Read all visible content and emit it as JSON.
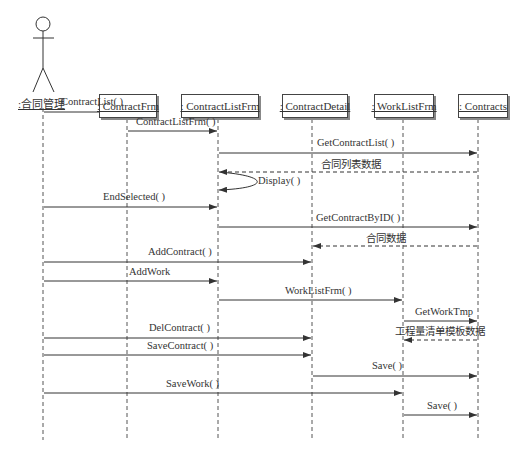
{
  "diagram": {
    "type": "UML sequence diagram",
    "actor": {
      "label": ":合同管理"
    },
    "lifelines": [
      {
        "id": "ContractFrm",
        "label": ": ContractFrm",
        "x": 127
      },
      {
        "id": "ContractListFrm",
        "label": ": ContractListFrm",
        "x": 218
      },
      {
        "id": "ContractDetail",
        "label": ": ContractDetail",
        "x": 312
      },
      {
        "id": "WorkListFrm",
        "label": ": WorkListFrm",
        "x": 403
      },
      {
        "id": "Contracts",
        "label": ": Contracts",
        "x": 478
      }
    ],
    "messages": [
      {
        "label": "ContractList( )",
        "from": "actor",
        "to": "ContractFrm",
        "kind": "call"
      },
      {
        "label": "ContractListFrm( )",
        "from": "ContractFrm",
        "to": "ContractListFrm",
        "kind": "call"
      },
      {
        "label": "GetContractList( )",
        "from": "ContractListFrm",
        "to": "Contracts",
        "kind": "call"
      },
      {
        "label": "合同列表数据",
        "from": "Contracts",
        "to": "ContractListFrm",
        "kind": "return"
      },
      {
        "label": "Display( )",
        "from": "ContractListFrm",
        "to": "ContractListFrm",
        "kind": "self"
      },
      {
        "label": "EndSelected( )",
        "from": "actor",
        "to": "ContractListFrm",
        "kind": "call"
      },
      {
        "label": "GetContractByID( )",
        "from": "ContractListFrm",
        "to": "Contracts",
        "kind": "call"
      },
      {
        "label": "合同数据",
        "from": "Contracts",
        "to": "ContractDetail",
        "kind": "return"
      },
      {
        "label": "AddContract( )",
        "from": "actor",
        "to": "ContractDetail",
        "kind": "call"
      },
      {
        "label": "AddWork",
        "from": "actor",
        "to": "ContractListFrm",
        "kind": "call"
      },
      {
        "label": "WorkListFrm( )",
        "from": "ContractListFrm",
        "to": "WorkListFrm",
        "kind": "call"
      },
      {
        "label": "GetWorkTmp",
        "from": "WorkListFrm",
        "to": "Contracts",
        "kind": "call"
      },
      {
        "label": "工程量清单模板数据",
        "from": "Contracts",
        "to": "WorkListFrm",
        "kind": "return"
      },
      {
        "label": "DelContract( )",
        "from": "actor",
        "to": "ContractDetail",
        "kind": "call"
      },
      {
        "label": "SaveContract( )",
        "from": "actor",
        "to": "ContractDetail",
        "kind": "call"
      },
      {
        "label": "Save( )",
        "from": "ContractDetail",
        "to": "Contracts",
        "kind": "call"
      },
      {
        "label": "SaveWork( )",
        "from": "actor",
        "to": "WorkListFrm",
        "kind": "call"
      },
      {
        "label": "Save( )",
        "from": "WorkListFrm",
        "to": "Contracts",
        "kind": "call"
      }
    ]
  }
}
